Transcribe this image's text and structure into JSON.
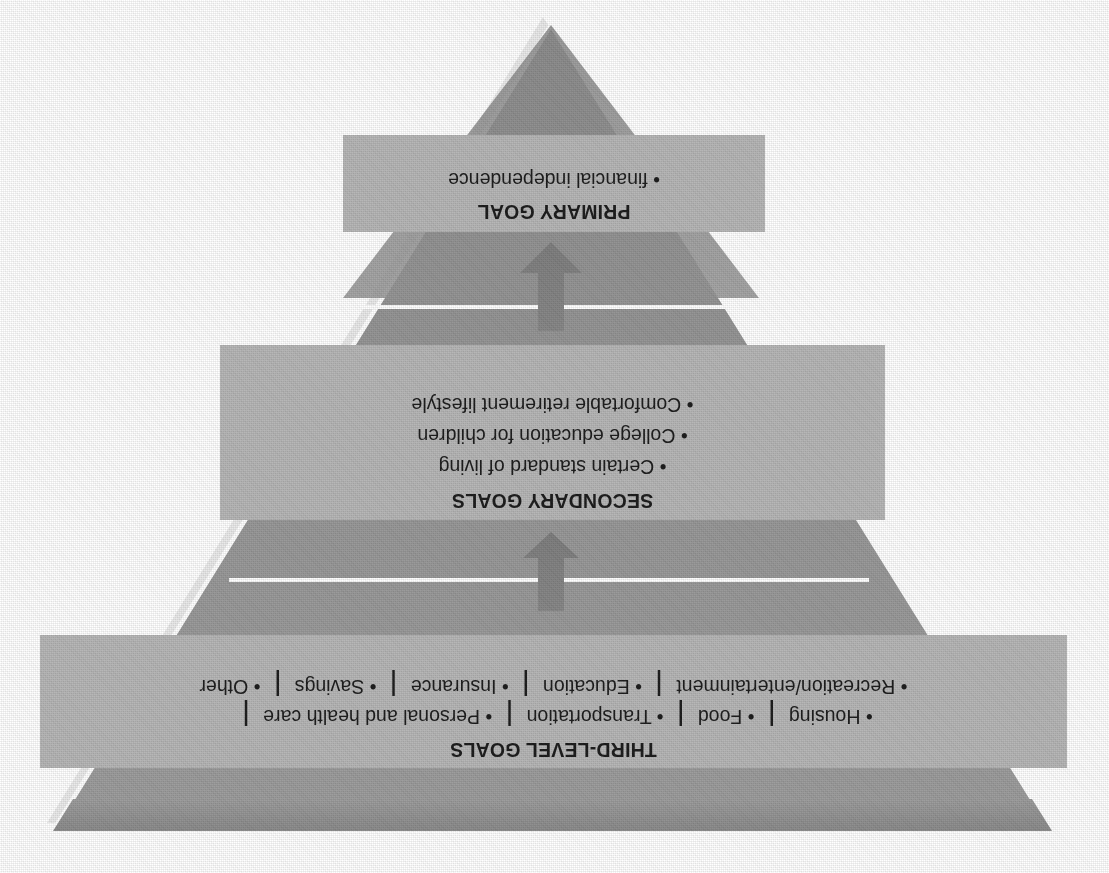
{
  "diagram": {
    "type": "inverted-funnel",
    "orientation": "rotated-180-degrees",
    "title_present": false,
    "colors": {
      "funnel_fill": "#9a9a9a",
      "funnel_fill_dark": "#8e8e8e",
      "panel_fill": "#b6b6b6",
      "outline": "#ffffff",
      "text": "#1b1b1b",
      "arrow": "#8a8a8a",
      "background": "#ffffff"
    },
    "levels": [
      {
        "id": "third-level",
        "heading": "THIRD-LEVEL GOALS",
        "bullet_lines": [
          [
            "Housing",
            "Food",
            "Transportation",
            "Personal and health care"
          ],
          [
            "Recreation/entertainment",
            "Education",
            "Insurance",
            "Savings",
            "Other"
          ]
        ],
        "line1_trailing_separator": true,
        "bullet_char": "•",
        "separator_char": "|"
      },
      {
        "id": "secondary",
        "heading": "SECONDARY GOALS",
        "bullet_lines": [
          [
            "Certain standard of living"
          ],
          [
            "College education for children"
          ],
          [
            "Comfortable retirement lifestyle"
          ]
        ],
        "bullet_char": "•",
        "separator_char": "|"
      },
      {
        "id": "primary",
        "heading": "PRIMARY GOAL",
        "bullet_lines": [
          [
            "financial independence"
          ]
        ],
        "bullet_char": "•",
        "separator_char": "|"
      }
    ],
    "arrows": [
      {
        "id": "arrow-third-to-secondary",
        "direction": "down"
      },
      {
        "id": "arrow-secondary-to-primary",
        "direction": "down"
      }
    ]
  }
}
